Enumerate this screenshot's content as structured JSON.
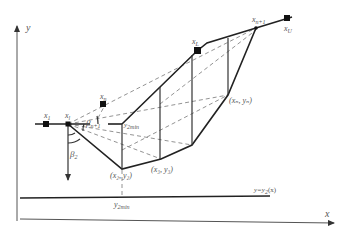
{
  "diagram": {
    "type": "slope stability slip surface search schematic",
    "axes": {
      "x_label": "x",
      "y_label": "y"
    },
    "points": {
      "x1": {
        "label": "x",
        "sub": "1"
      },
      "xl": {
        "label": "x",
        "sub": "l"
      },
      "xn_top": {
        "label": "x",
        "sub": "n"
      },
      "xL": {
        "label": "x",
        "sub": "L"
      },
      "xn1": {
        "label": "x",
        "sub": "n+1"
      },
      "xU": {
        "label": "x",
        "sub": "U"
      }
    },
    "coordinate_labels": {
      "p2": "(x₂, y₂)",
      "p3": "(x₃, y₃)",
      "pn": "(xₙ, yₙ)"
    },
    "angles": {
      "beta_n1": {
        "label": "β",
        "sub": "n+1"
      },
      "beta_2": {
        "label": "β",
        "sub": "2"
      }
    },
    "y2min_inner": {
      "label": "y",
      "sub": "2min"
    },
    "y2min_bottom": {
      "label": "y",
      "sub": "2min"
    },
    "bound_line": {
      "label": "y=y",
      "sub": "2",
      "suffix": "(x)"
    }
  }
}
